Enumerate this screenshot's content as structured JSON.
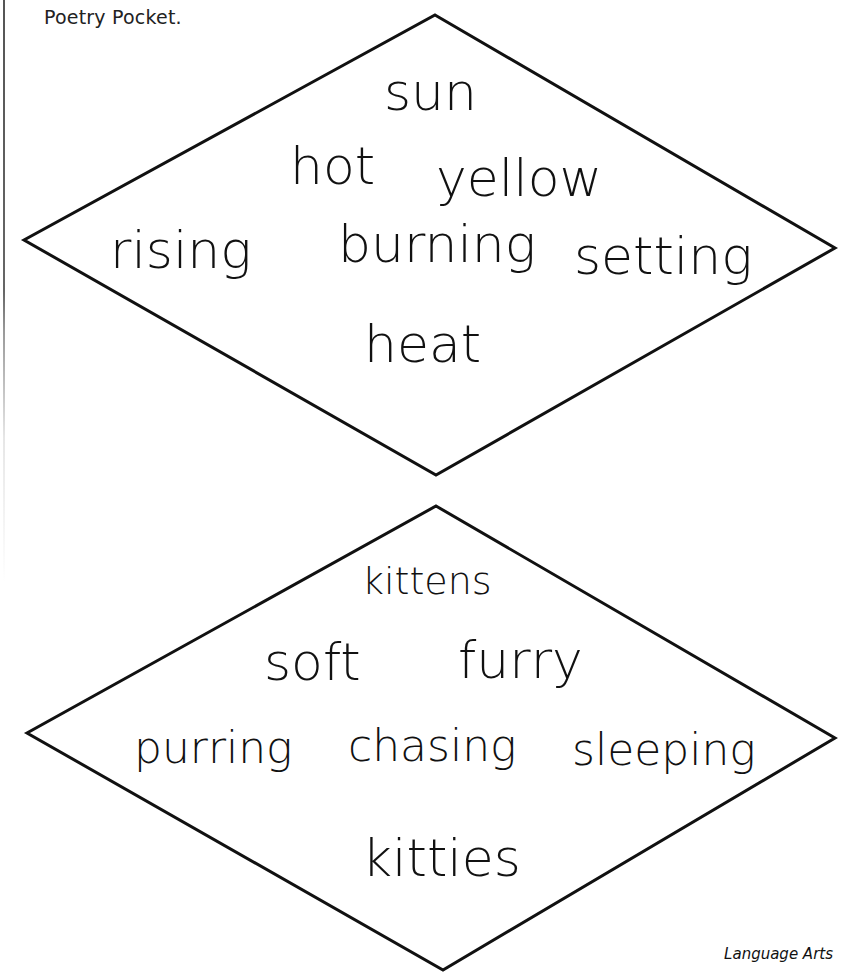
{
  "page": {
    "heading": "Poetry Pocket.",
    "footer": "Language Arts"
  },
  "colors": {
    "ink": "#111111",
    "paper": "#ffffff"
  },
  "poems": [
    {
      "shape": "diamond",
      "vertices": {
        "top": [
          435,
          15
        ],
        "left": [
          24,
          240
        ],
        "right": [
          835,
          248
        ],
        "bottom": [
          436,
          475
        ]
      },
      "lines": [
        {
          "words": [
            "sun"
          ]
        },
        {
          "words": [
            "hot",
            "yellow"
          ]
        },
        {
          "words": [
            "rising",
            "burning",
            "setting"
          ]
        },
        {
          "words": [
            "heat"
          ]
        }
      ]
    },
    {
      "shape": "diamond",
      "vertices": {
        "top": [
          436,
          506
        ],
        "left": [
          27,
          733
        ],
        "right": [
          835,
          738
        ],
        "bottom": [
          443,
          970
        ]
      },
      "lines": [
        {
          "words": [
            "kittens"
          ]
        },
        {
          "words": [
            "soft",
            "furry"
          ]
        },
        {
          "words": [
            "purring",
            "chasing",
            "sleeping"
          ]
        },
        {
          "words": [
            "kitties"
          ]
        }
      ]
    }
  ]
}
